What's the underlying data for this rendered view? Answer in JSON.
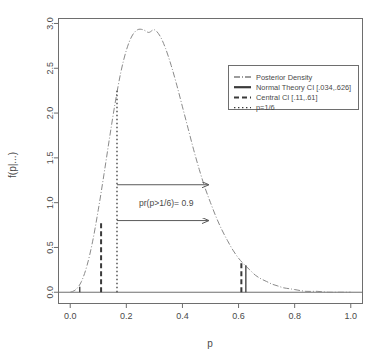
{
  "chart_data": {
    "type": "line",
    "title": "",
    "xlabel": "p",
    "ylabel": "f(p|...)",
    "xlim": [
      -0.04,
      1.04
    ],
    "ylim": [
      -0.12,
      3.05
    ],
    "xticks": [
      "0.0",
      "0.2",
      "0.4",
      "0.6",
      "0.8",
      "1.0"
    ],
    "xtick_values": [
      0.0,
      0.2,
      0.4,
      0.6,
      0.8,
      1.0
    ],
    "yticks": [
      "0.0",
      "0.5",
      "1.0",
      "1.5",
      "2.0",
      "2.5",
      "3.0"
    ],
    "ytick_values": [
      0.0,
      0.5,
      1.0,
      1.5,
      2.0,
      2.5,
      3.0
    ],
    "grid": false,
    "legend_position": "upper right",
    "series": [
      {
        "name": "Posterior Density",
        "style": "dotdash",
        "x": [
          0.0,
          0.02,
          0.04,
          0.06,
          0.08,
          0.1,
          0.12,
          0.14,
          0.16,
          0.18,
          0.2,
          0.22,
          0.24,
          0.26,
          0.28,
          0.3,
          0.32,
          0.34,
          0.36,
          0.38,
          0.4,
          0.42,
          0.44,
          0.46,
          0.48,
          0.5,
          0.52,
          0.54,
          0.56,
          0.58,
          0.6,
          0.62,
          0.64,
          0.66,
          0.68,
          0.7,
          0.72,
          0.74,
          0.76,
          0.78,
          0.8,
          0.84,
          0.88,
          0.92,
          0.96,
          1.0
        ],
        "y": [
          0.0,
          0.03,
          0.12,
          0.3,
          0.57,
          0.92,
          1.31,
          1.72,
          2.11,
          2.45,
          2.7,
          2.86,
          2.93,
          2.93,
          2.9,
          2.93,
          2.86,
          2.72,
          2.53,
          2.31,
          2.07,
          1.83,
          1.59,
          1.37,
          1.17,
          1.0,
          0.84,
          0.7,
          0.58,
          0.47,
          0.38,
          0.31,
          0.25,
          0.19,
          0.15,
          0.12,
          0.09,
          0.07,
          0.05,
          0.04,
          0.03,
          0.01,
          0.01,
          0.0,
          0.0,
          0.0
        ]
      }
    ],
    "markers": [
      {
        "name": "normal-theory-ci-lower",
        "x": 0.034,
        "y_top": 0.06,
        "style": "solid"
      },
      {
        "name": "normal-theory-ci-upper",
        "x": 0.626,
        "y_top": 0.3,
        "style": "solid"
      },
      {
        "name": "central-ci-lower",
        "x": 0.11,
        "y_top": 0.78,
        "style": "dashed"
      },
      {
        "name": "central-ci-upper",
        "x": 0.61,
        "y_top": 0.34,
        "style": "dashed"
      },
      {
        "name": "p-one-sixth",
        "x": 0.1667,
        "y_top": 2.27,
        "style": "dotted"
      }
    ],
    "annotations": [
      {
        "name": "probability-annotation",
        "text": "pr(p>1/6)= 0.9",
        "x": 0.245,
        "y": 1.0
      },
      {
        "name": "arrow-upper",
        "x_start": 0.1667,
        "x_end": 0.5,
        "y": 1.2
      },
      {
        "name": "arrow-lower",
        "x_start": 0.1667,
        "x_end": 0.5,
        "y": 0.8
      }
    ],
    "legend": [
      {
        "label": "Posterior Density",
        "style": "dotdash"
      },
      {
        "label": "Normal Theory CI [.034,.626]",
        "style": "solid"
      },
      {
        "label": "Central CI [.11,.61]",
        "style": "dashed"
      },
      {
        "label": "p=1/6",
        "style": "dotted"
      }
    ],
    "colors": {
      "density": "#8a8a8a",
      "axis": "#6e6e6e",
      "text": "#4a4a4a",
      "marker": "#3a3a3a",
      "background": "#ffffff"
    }
  }
}
